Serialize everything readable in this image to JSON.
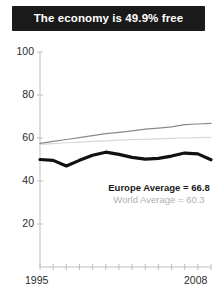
{
  "title": "The economy is 49.9% free",
  "legend": {
    "europe": "Europe Average = 66.8",
    "world": "World Average = 60.3"
  },
  "axis": {
    "y_ticks": [
      "100",
      "80",
      "60",
      "40",
      "20"
    ],
    "x_start": "1995",
    "x_end": "2008"
  },
  "colors": {
    "banner_bg": "#1a1a1a",
    "banner_text": "#ffffff",
    "country_line": "#111111",
    "europe_line": "#8a8a8a",
    "world_line": "#d8d8d8",
    "axis": "#bfbfbf",
    "tick_text": "#2b2b2b"
  },
  "chart_data": {
    "type": "line",
    "title": "The economy is 49.9% free",
    "xlabel": "",
    "ylabel": "",
    "xlim": [
      1995,
      2008
    ],
    "ylim": [
      0,
      100
    ],
    "ytick_values": [
      20,
      40,
      60,
      80,
      100
    ],
    "grid": false,
    "legend_position": "inside-lower-right",
    "x": [
      1995,
      1996,
      1997,
      1998,
      1999,
      2000,
      2001,
      2002,
      2003,
      2004,
      2005,
      2006,
      2007,
      2008
    ],
    "series": [
      {
        "name": "Country",
        "color": "#111111",
        "width": 3.2,
        "values": [
          50.0,
          49.6,
          47.0,
          49.6,
          52.0,
          53.4,
          52.4,
          51.0,
          50.2,
          50.5,
          51.6,
          53.0,
          52.6,
          49.9
        ]
      },
      {
        "name": "Europe Average",
        "color": "#8a8a8a",
        "width": 1.2,
        "label": "Europe Average = 66.8",
        "values": [
          57.5,
          58.4,
          59.3,
          60.2,
          61.1,
          62.0,
          62.6,
          63.3,
          64.1,
          64.6,
          65.2,
          66.2,
          66.5,
          66.8
        ]
      },
      {
        "name": "World Average",
        "color": "#d8d8d8",
        "width": 1.2,
        "label": "World Average = 60.3",
        "values": [
          57.0,
          57.4,
          57.8,
          58.1,
          58.4,
          58.7,
          59.0,
          59.2,
          59.4,
          59.6,
          59.8,
          60.0,
          60.2,
          60.3
        ]
      }
    ]
  }
}
